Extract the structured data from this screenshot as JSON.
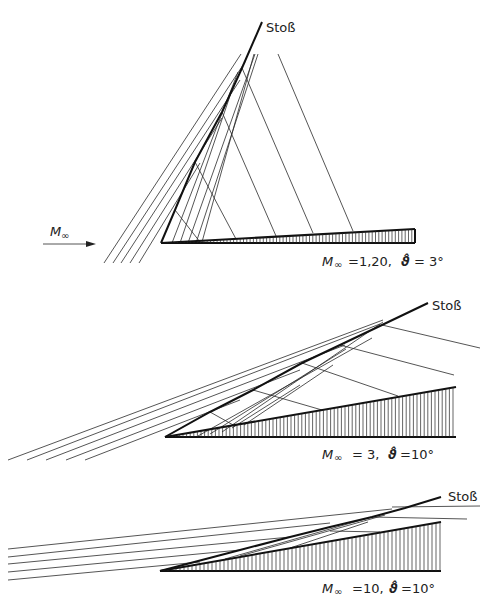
{
  "figure": {
    "shock_label": "Stoß",
    "freestream_label": "M",
    "freestream_sub": "∞",
    "caption_partial": "…Ü…"
  },
  "diagrams": [
    {
      "id": "d1",
      "mach_symbol": "M",
      "mach_sub": "∞",
      "mach_value": "=1,20,",
      "angle_symbol": "ϑ̂",
      "angle_value": "= 3°",
      "shock_label": "Stoß"
    },
    {
      "id": "d2",
      "mach_symbol": "M",
      "mach_sub": "∞",
      "mach_value": "= 3,",
      "angle_symbol": "ϑ̂",
      "angle_value": "=10°",
      "shock_label": "Stoß"
    },
    {
      "id": "d3",
      "mach_symbol": "M",
      "mach_sub": "∞",
      "mach_value": "=10,",
      "angle_symbol": "ϑ̂",
      "angle_value": "=10°",
      "shock_label": "Stoß"
    }
  ],
  "colors": {
    "line": "#2a2a2a",
    "background": "#ffffff"
  }
}
